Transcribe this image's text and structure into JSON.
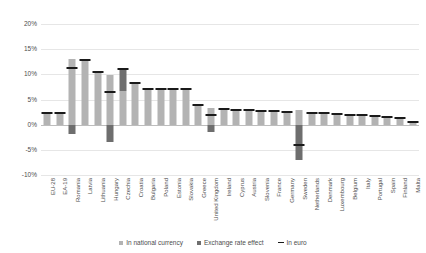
{
  "chart_data": {
    "type": "bar",
    "title": "",
    "subtitle": "",
    "xlabel": "",
    "ylabel": "",
    "ylim": [
      -10,
      20
    ],
    "yticks": [
      20,
      15,
      10,
      5,
      0,
      -5,
      -10
    ],
    "ytick_labels": [
      "20%",
      "15%",
      "10%",
      "5%",
      "0%",
      "-5%",
      "-10%"
    ],
    "grid": true,
    "stacked": true,
    "legend_position": "bottom",
    "categories": [
      "EU-28",
      "EA-19",
      "Romania",
      "Latvia",
      "Lithuania",
      "Hungary",
      "Czechia",
      "Croatia",
      "Bulgaria",
      "Poland",
      "Estonia",
      "Slovakia",
      "Greece",
      "United Kingdom",
      "Ireland",
      "Cyprus",
      "Austria",
      "Slovenia",
      "France",
      "Germany",
      "Sweden",
      "Netherlands",
      "Denmark",
      "Luxembourg",
      "Belgium",
      "Italy",
      "Portugal",
      "Spain",
      "Finland",
      "Malta"
    ],
    "series": [
      {
        "name": "In national currency",
        "values": [
          2.3,
          2.3,
          13.0,
          12.8,
          10.4,
          9.9,
          6.6,
          8.2,
          7.0,
          7.0,
          7.0,
          7.0,
          3.9,
          3.4,
          3.1,
          3.0,
          2.9,
          2.8,
          2.7,
          2.6,
          3.0,
          2.4,
          2.3,
          2.1,
          2.0,
          1.9,
          1.7,
          1.5,
          1.3,
          0.5
        ]
      },
      {
        "name": "Exchange rate effect",
        "values": [
          0.0,
          0.0,
          -1.8,
          0.0,
          0.0,
          -3.4,
          4.5,
          0.0,
          0.0,
          0.0,
          0.0,
          0.0,
          0.0,
          -1.4,
          0.0,
          0.0,
          0.0,
          0.0,
          0.0,
          0.0,
          -7.1,
          0.0,
          0.0,
          0.0,
          0.0,
          0.0,
          0.0,
          0.0,
          0.0,
          0.0
        ]
      }
    ],
    "euro_series": {
      "name": "In euro",
      "values": [
        2.3,
        2.3,
        11.2,
        12.8,
        10.4,
        6.5,
        11.1,
        8.2,
        7.0,
        7.0,
        7.0,
        7.0,
        3.9,
        2.0,
        3.1,
        3.0,
        2.9,
        2.8,
        2.7,
        2.6,
        -4.1,
        2.4,
        2.3,
        2.1,
        2.0,
        1.9,
        1.7,
        1.5,
        1.3,
        0.5
      ]
    },
    "colors": {
      "national_currency": "#b3b3b3",
      "exchange_rate_effect": "#6e6e6e",
      "in_euro": "#1a1a1a",
      "gridline": "#e6e6e6",
      "axis": "#bdbdbd",
      "text": "#4d4d4d"
    }
  },
  "legend": {
    "items": [
      {
        "label": "In national currency",
        "type": "square"
      },
      {
        "label": "Exchange rate effect",
        "type": "square"
      },
      {
        "label": "In euro",
        "type": "line"
      }
    ]
  }
}
